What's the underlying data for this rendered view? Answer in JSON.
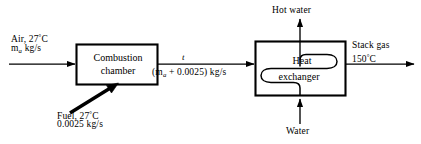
{
  "diagram": {
    "units": {
      "mass_flow": "kg/s",
      "temperature": "°C"
    },
    "colors": {
      "stroke": "#000000",
      "background": "#ffffff"
    }
  },
  "components": {
    "combustion_chamber": {
      "name": "combustion-chamber",
      "line1": "Combustion",
      "line2": "chamber"
    },
    "heat_exchanger": {
      "name": "heat-exchanger",
      "line1": "Heat",
      "line2": "exchanger",
      "coil": "serpentine-tube"
    }
  },
  "streams": {
    "air_inlet": {
      "label": "Air, 27",
      "degree": "°",
      "unit": "C",
      "flow_symbol": "m",
      "flow_subscript": "a",
      "flow_units": "kg/s",
      "direction": "right"
    },
    "fuel_inlet": {
      "label": "Fuel, 27",
      "degree": "°",
      "unit": "C",
      "flow_value": "0.0025 kg/s",
      "direction": "up-right"
    },
    "combustion_products": {
      "point_label": "t",
      "open_paren": "(",
      "flow_symbol": "m",
      "flow_subscript": "a",
      "expression": "+  0.0025) kg/s",
      "direction": "right"
    },
    "stack_gas": {
      "label": "Stack gas",
      "temperature": "150",
      "degree": "°",
      "unit": "C",
      "direction": "right"
    },
    "hot_water_outlet": {
      "label": "Hot water",
      "direction": "up"
    },
    "water_inlet": {
      "label": "Water",
      "direction": "up"
    }
  }
}
